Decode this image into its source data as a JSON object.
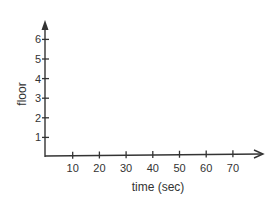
{
  "chart_data": {
    "type": "line",
    "title": "",
    "xlabel": "time (sec)",
    "ylabel": "floor",
    "x_ticks": [
      10,
      20,
      30,
      40,
      50,
      60,
      70
    ],
    "y_ticks": [
      1,
      2,
      3,
      4,
      5,
      6
    ],
    "xlim": [
      0,
      80
    ],
    "ylim": [
      0,
      6.8
    ],
    "grid": false,
    "series": []
  }
}
